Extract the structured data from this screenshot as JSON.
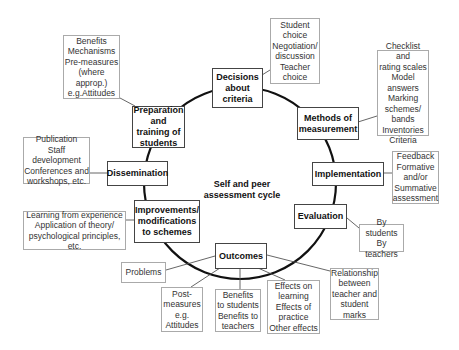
{
  "diagram": {
    "center_label": "Self and peer\nassessment cycle",
    "cycle_stages": [
      {
        "id": "decisions",
        "label": "Decisions\nabout criteria",
        "details": "Student\nchoice\nNegotiation/\ndiscussion\nTeacher\nchoice"
      },
      {
        "id": "methods",
        "label": "Methods of\nmeasurement",
        "details": "Checklist and\nrating scales\nModel\nanswers\nMarking\nschemes/\nbands\nInventories\nCriteria"
      },
      {
        "id": "implementation",
        "label": "Implementation",
        "details": "Feedback\nFormative\nand/or\nSummative\nassessment"
      },
      {
        "id": "evaluation",
        "label": "Evaluation",
        "details": "By students\nBy teachers"
      },
      {
        "id": "outcomes",
        "label": "Outcomes",
        "details_list": [
          "Problems",
          "Post-\nmeasures\ne.g.\nAttitudes",
          "Benefits\nto students\nBenefits to\nteachers",
          "Effects on\nlearning\nEffects of\npractice\nOther effects",
          "Relationship\nbetween\nteacher and\nstudent\nmarks"
        ]
      },
      {
        "id": "improvements",
        "label": "Improvements/\nmodifications\nto schemes",
        "details": "Learning from experience\nApplication of theory/\npsychological principles, etc."
      },
      {
        "id": "dissemination",
        "label": "Dissemination",
        "details": "Publication\nStaff development\nConferences and\nworkshops, etc."
      },
      {
        "id": "preparation",
        "label": "Preparation\nand\ntraining of\nstudents",
        "details": "Benefits\nMechanisms\nPre-measures\n(where\napprop.)\ne.g.Attitudes"
      }
    ]
  },
  "colors": {
    "main_border": "#444444",
    "sub_border": "#aaaaaa",
    "cycle_line": "#111111",
    "connector": "#555555"
  }
}
